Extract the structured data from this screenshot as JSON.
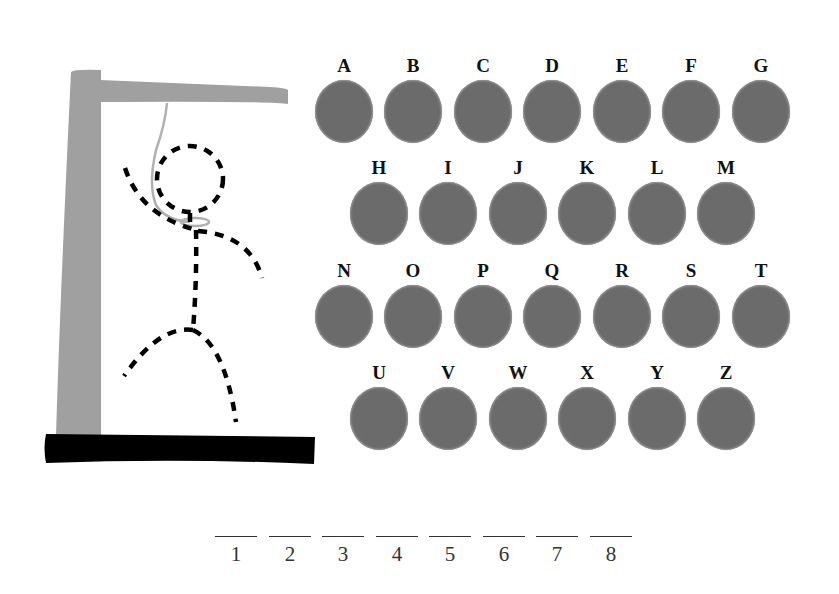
{
  "game": {
    "type": "hangman",
    "colors": {
      "gallows": "#a0a0a0",
      "base": "#000000",
      "rope": "#b0b0b0",
      "figure": "#000000",
      "letter_circle": "#6b6b6b",
      "text": "#111111"
    }
  },
  "keyboard": {
    "rows": [
      [
        "A",
        "B",
        "C",
        "D",
        "E",
        "F",
        "G"
      ],
      [
        "H",
        "I",
        "J",
        "K",
        "L",
        "M"
      ],
      [
        "N",
        "O",
        "P",
        "Q",
        "R",
        "S",
        "T"
      ],
      [
        "U",
        "V",
        "W",
        "X",
        "Y",
        "Z"
      ]
    ]
  },
  "word": {
    "length": 8,
    "slots": [
      "1",
      "2",
      "3",
      "4",
      "5",
      "6",
      "7",
      "8"
    ]
  }
}
